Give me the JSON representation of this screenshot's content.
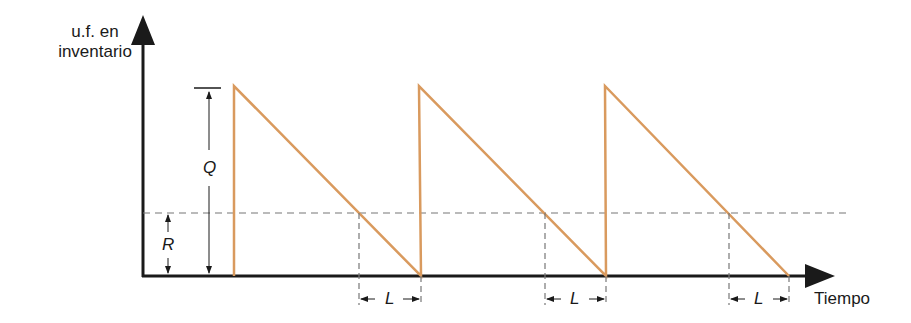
{
  "diagram": {
    "y_axis_label_line1": "u.f. en",
    "y_axis_label_line2": "inventario",
    "x_axis_label": "Tiempo",
    "q_label": "Q",
    "r_label": "R",
    "lead_time_label": "L",
    "colors": {
      "inventory_line": "#d99a5e",
      "axis": "#1a1a1a",
      "dashed": "#777777"
    },
    "cycles": [
      {
        "order_time_x": 234,
        "stockout_x": 421,
        "reorder_x": 359
      },
      {
        "order_time_x": 419,
        "stockout_x": 606,
        "reorder_x": 545
      },
      {
        "order_time_x": 605,
        "stockout_x": 789,
        "reorder_x": 729
      }
    ]
  }
}
